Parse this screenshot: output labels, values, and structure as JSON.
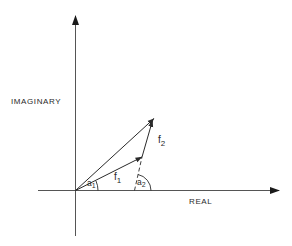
{
  "diagram": {
    "type": "phasor vector addition on complex plane",
    "axes": {
      "x_label": "REAL",
      "y_label": "IMAGINARY"
    },
    "vectors": [
      {
        "name": "f",
        "sub": "1",
        "description": "first phasor from origin"
      },
      {
        "name": "f",
        "sub": "2",
        "description": "second phasor added tip-to-tail"
      },
      {
        "name": "resultant",
        "description": "sum of f1 and f2 from origin"
      }
    ],
    "angles": [
      {
        "name": "a",
        "sub": "1",
        "description": "angle of f1 from real axis"
      },
      {
        "name": "a",
        "sub": "2",
        "description": "angle of f2 from real axis"
      }
    ],
    "colors": {
      "ink": "#2a2a2a",
      "background": "#ffffff"
    }
  }
}
